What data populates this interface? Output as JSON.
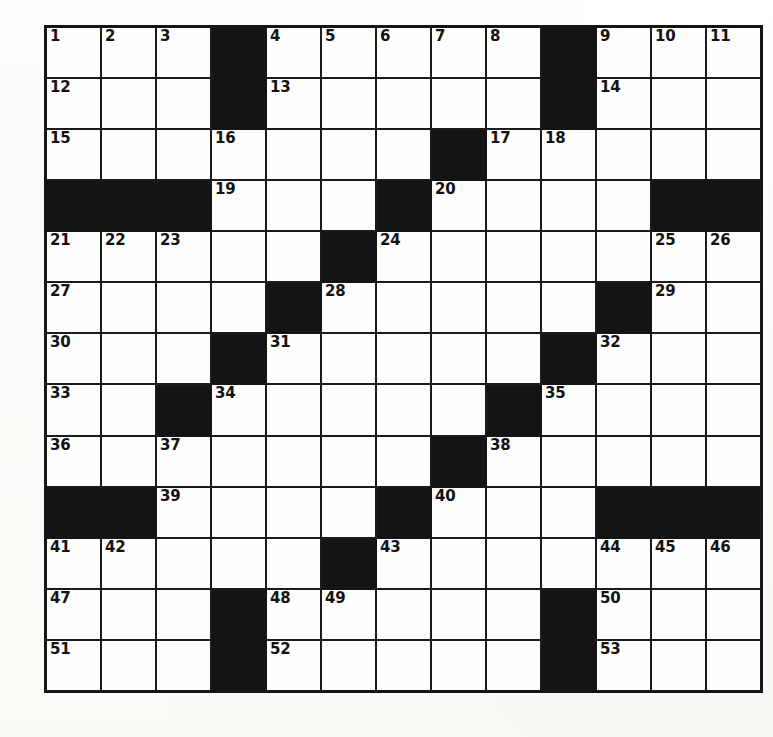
{
  "puzzle": {
    "title": "Crossword Puzzle Grid",
    "columns": 13,
    "rows": 13,
    "colors": {
      "block": "#141414",
      "cell": "#fefefe",
      "grid_line": "#1b1b1b",
      "outer_border": "#151515",
      "number_text": "#121212",
      "page_background": "#fdfdfb"
    },
    "grid": [
      [
        {
          "type": "open",
          "number": "1"
        },
        {
          "type": "open",
          "number": "2"
        },
        {
          "type": "open",
          "number": "3"
        },
        {
          "type": "block",
          "number": ""
        },
        {
          "type": "open",
          "number": "4"
        },
        {
          "type": "open",
          "number": "5"
        },
        {
          "type": "open",
          "number": "6"
        },
        {
          "type": "open",
          "number": "7"
        },
        {
          "type": "open",
          "number": "8"
        },
        {
          "type": "block",
          "number": ""
        },
        {
          "type": "open",
          "number": "9"
        },
        {
          "type": "open",
          "number": "10"
        },
        {
          "type": "open",
          "number": "11"
        }
      ],
      [
        {
          "type": "open",
          "number": "12"
        },
        {
          "type": "open",
          "number": ""
        },
        {
          "type": "open",
          "number": ""
        },
        {
          "type": "block",
          "number": ""
        },
        {
          "type": "open",
          "number": "13"
        },
        {
          "type": "open",
          "number": ""
        },
        {
          "type": "open",
          "number": ""
        },
        {
          "type": "open",
          "number": ""
        },
        {
          "type": "open",
          "number": ""
        },
        {
          "type": "block",
          "number": ""
        },
        {
          "type": "open",
          "number": "14"
        },
        {
          "type": "open",
          "number": ""
        },
        {
          "type": "open",
          "number": ""
        }
      ],
      [
        {
          "type": "open",
          "number": "15"
        },
        {
          "type": "open",
          "number": ""
        },
        {
          "type": "open",
          "number": ""
        },
        {
          "type": "open",
          "number": "16"
        },
        {
          "type": "open",
          "number": ""
        },
        {
          "type": "open",
          "number": ""
        },
        {
          "type": "open",
          "number": ""
        },
        {
          "type": "block",
          "number": ""
        },
        {
          "type": "open",
          "number": "17"
        },
        {
          "type": "open",
          "number": "18"
        },
        {
          "type": "open",
          "number": ""
        },
        {
          "type": "open",
          "number": ""
        },
        {
          "type": "open",
          "number": ""
        }
      ],
      [
        {
          "type": "block",
          "number": ""
        },
        {
          "type": "block",
          "number": ""
        },
        {
          "type": "block",
          "number": ""
        },
        {
          "type": "open",
          "number": "19"
        },
        {
          "type": "open",
          "number": ""
        },
        {
          "type": "open",
          "number": ""
        },
        {
          "type": "block",
          "number": ""
        },
        {
          "type": "open",
          "number": "20"
        },
        {
          "type": "open",
          "number": ""
        },
        {
          "type": "open",
          "number": ""
        },
        {
          "type": "open",
          "number": ""
        },
        {
          "type": "block",
          "number": ""
        },
        {
          "type": "block",
          "number": ""
        }
      ],
      [
        {
          "type": "open",
          "number": "21"
        },
        {
          "type": "open",
          "number": "22"
        },
        {
          "type": "open",
          "number": "23"
        },
        {
          "type": "open",
          "number": ""
        },
        {
          "type": "open",
          "number": ""
        },
        {
          "type": "block",
          "number": ""
        },
        {
          "type": "open",
          "number": "24"
        },
        {
          "type": "open",
          "number": ""
        },
        {
          "type": "open",
          "number": ""
        },
        {
          "type": "open",
          "number": ""
        },
        {
          "type": "open",
          "number": ""
        },
        {
          "type": "open",
          "number": "25"
        },
        {
          "type": "open",
          "number": "26"
        }
      ],
      [
        {
          "type": "open",
          "number": "27"
        },
        {
          "type": "open",
          "number": ""
        },
        {
          "type": "open",
          "number": ""
        },
        {
          "type": "open",
          "number": ""
        },
        {
          "type": "block",
          "number": ""
        },
        {
          "type": "open",
          "number": "28"
        },
        {
          "type": "open",
          "number": ""
        },
        {
          "type": "open",
          "number": ""
        },
        {
          "type": "open",
          "number": ""
        },
        {
          "type": "open",
          "number": ""
        },
        {
          "type": "block",
          "number": ""
        },
        {
          "type": "open",
          "number": "29"
        },
        {
          "type": "open",
          "number": ""
        }
      ],
      [
        {
          "type": "open",
          "number": "30"
        },
        {
          "type": "open",
          "number": ""
        },
        {
          "type": "open",
          "number": ""
        },
        {
          "type": "block",
          "number": ""
        },
        {
          "type": "open",
          "number": "31"
        },
        {
          "type": "open",
          "number": ""
        },
        {
          "type": "open",
          "number": ""
        },
        {
          "type": "open",
          "number": ""
        },
        {
          "type": "open",
          "number": ""
        },
        {
          "type": "block",
          "number": ""
        },
        {
          "type": "open",
          "number": "32"
        },
        {
          "type": "open",
          "number": ""
        },
        {
          "type": "open",
          "number": ""
        }
      ],
      [
        {
          "type": "open",
          "number": "33"
        },
        {
          "type": "open",
          "number": ""
        },
        {
          "type": "block",
          "number": ""
        },
        {
          "type": "open",
          "number": "34"
        },
        {
          "type": "open",
          "number": ""
        },
        {
          "type": "open",
          "number": ""
        },
        {
          "type": "open",
          "number": ""
        },
        {
          "type": "open",
          "number": ""
        },
        {
          "type": "block",
          "number": ""
        },
        {
          "type": "open",
          "number": "35"
        },
        {
          "type": "open",
          "number": ""
        },
        {
          "type": "open",
          "number": ""
        },
        {
          "type": "open",
          "number": ""
        }
      ],
      [
        {
          "type": "open",
          "number": "36"
        },
        {
          "type": "open",
          "number": ""
        },
        {
          "type": "open",
          "number": "37"
        },
        {
          "type": "open",
          "number": ""
        },
        {
          "type": "open",
          "number": ""
        },
        {
          "type": "open",
          "number": ""
        },
        {
          "type": "open",
          "number": ""
        },
        {
          "type": "block",
          "number": ""
        },
        {
          "type": "open",
          "number": "38"
        },
        {
          "type": "open",
          "number": ""
        },
        {
          "type": "open",
          "number": ""
        },
        {
          "type": "open",
          "number": ""
        },
        {
          "type": "open",
          "number": ""
        }
      ],
      [
        {
          "type": "block",
          "number": ""
        },
        {
          "type": "block",
          "number": ""
        },
        {
          "type": "open",
          "number": "39"
        },
        {
          "type": "open",
          "number": ""
        },
        {
          "type": "open",
          "number": ""
        },
        {
          "type": "open",
          "number": ""
        },
        {
          "type": "block",
          "number": ""
        },
        {
          "type": "open",
          "number": "40"
        },
        {
          "type": "open",
          "number": ""
        },
        {
          "type": "open",
          "number": ""
        },
        {
          "type": "block",
          "number": ""
        },
        {
          "type": "block",
          "number": ""
        },
        {
          "type": "block",
          "number": ""
        }
      ],
      [
        {
          "type": "open",
          "number": "41"
        },
        {
          "type": "open",
          "number": "42"
        },
        {
          "type": "open",
          "number": ""
        },
        {
          "type": "open",
          "number": ""
        },
        {
          "type": "open",
          "number": ""
        },
        {
          "type": "block",
          "number": ""
        },
        {
          "type": "open",
          "number": "43"
        },
        {
          "type": "open",
          "number": ""
        },
        {
          "type": "open",
          "number": ""
        },
        {
          "type": "open",
          "number": ""
        },
        {
          "type": "open",
          "number": "44"
        },
        {
          "type": "open",
          "number": "45"
        },
        {
          "type": "open",
          "number": "46"
        }
      ],
      [
        {
          "type": "open",
          "number": "47"
        },
        {
          "type": "open",
          "number": ""
        },
        {
          "type": "open",
          "number": ""
        },
        {
          "type": "block",
          "number": ""
        },
        {
          "type": "open",
          "number": "48"
        },
        {
          "type": "open",
          "number": "49"
        },
        {
          "type": "open",
          "number": ""
        },
        {
          "type": "open",
          "number": ""
        },
        {
          "type": "open",
          "number": ""
        },
        {
          "type": "block",
          "number": ""
        },
        {
          "type": "open",
          "number": "50"
        },
        {
          "type": "open",
          "number": ""
        },
        {
          "type": "open",
          "number": ""
        }
      ],
      [
        {
          "type": "open",
          "number": "51"
        },
        {
          "type": "open",
          "number": ""
        },
        {
          "type": "open",
          "number": ""
        },
        {
          "type": "block",
          "number": ""
        },
        {
          "type": "open",
          "number": "52"
        },
        {
          "type": "open",
          "number": ""
        },
        {
          "type": "open",
          "number": ""
        },
        {
          "type": "open",
          "number": ""
        },
        {
          "type": "open",
          "number": ""
        },
        {
          "type": "block",
          "number": ""
        },
        {
          "type": "open",
          "number": "53"
        },
        {
          "type": "open",
          "number": ""
        },
        {
          "type": "open",
          "number": ""
        }
      ]
    ]
  }
}
